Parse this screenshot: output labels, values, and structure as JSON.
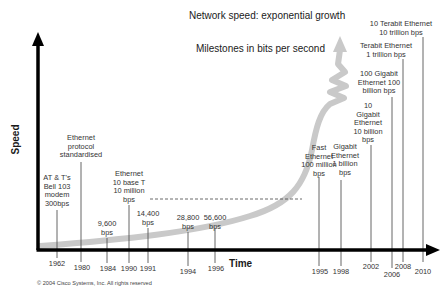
{
  "title": "Network speed: exponential growth",
  "subtitle": "Milestones in bits per second",
  "axes": {
    "y_label": "Speed",
    "x_label": "Time"
  },
  "copyright": "© 2004 Cisco Systems, Inc. All rights reserved",
  "milestones": [
    {
      "year": "1962",
      "line1": "AT & T's",
      "line2": "Bell 103",
      "line3": "modem",
      "line4": "300bps"
    },
    {
      "year": "1980",
      "line1": "Ethernet",
      "line2": "protocol",
      "line3": "standardised"
    },
    {
      "year": "1984",
      "line1": "9,600",
      "line2": "bps"
    },
    {
      "year": "1990",
      "line1": "Ethernet",
      "line2": "10 base T",
      "line3": "10 million",
      "line4": "bps"
    },
    {
      "year": "1991",
      "line1": "14,400",
      "line2": "bps"
    },
    {
      "year": "1994",
      "line1": "28,800",
      "line2": "bps"
    },
    {
      "year": "1996",
      "line1": "56,600",
      "line2": "bps"
    },
    {
      "year": "1995",
      "line1": "Fast",
      "line2": "Ethernet",
      "line3": "100 million",
      "line4": "bps"
    },
    {
      "year": "1998",
      "line1": "Gigabit",
      "line2": "Ethernet",
      "line3": "1 billion",
      "line4": "bps"
    },
    {
      "year": "2002",
      "line1": "10",
      "line2": "Gigabit",
      "line3": "Ethernet",
      "line4": "10 billion",
      "line5": "bps"
    },
    {
      "year": "2006",
      "line1": "100 Gigabit",
      "line2": "Ethernet 100",
      "line3": "billion bps"
    },
    {
      "year": "2008",
      "line1": "Terabit Ethernet",
      "line2": "1 trillion bps"
    },
    {
      "year": "2010",
      "line1": "10 Terabit Ethernet",
      "line2": "10 trillion bps"
    }
  ],
  "colors": {
    "axis": "#000000",
    "curve": "#c8c8c8",
    "leader": "#555555",
    "text": "#333333"
  }
}
